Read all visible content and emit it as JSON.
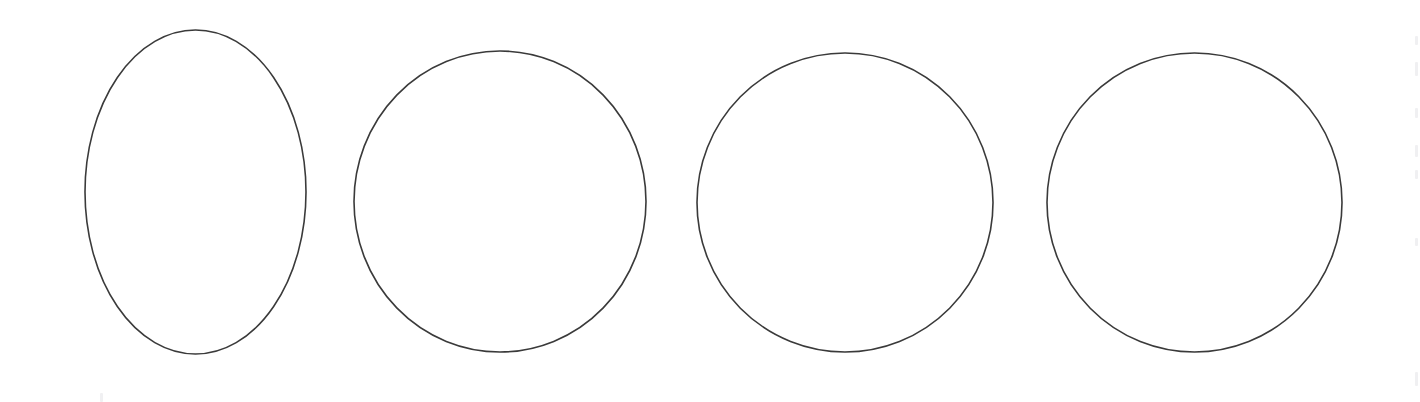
{
  "page": {
    "width": 1420,
    "height": 402,
    "background_color": "#ffffff"
  },
  "style": {
    "stroke_color": "#3a3a3a",
    "stroke_width": 1.6,
    "fill": "none",
    "artifact_color": "#f0f0f2"
  },
  "chart_data": {
    "type": "scatter",
    "title": "",
    "subtitle": "",
    "xlabel": "",
    "ylabel": "",
    "grid": false,
    "legend": "none",
    "xlim": [
      0,
      1420
    ],
    "ylim": [
      0,
      402
    ],
    "shapes": [
      {
        "id": "shape-1",
        "label": "Ellipse",
        "kind": "ellipse",
        "cx": 195.5,
        "cy": 192,
        "rx": 110.5,
        "ry": 162,
        "width": 221,
        "height": 324,
        "left": 85,
        "top": 30,
        "right": 306,
        "bottom": 354,
        "aspect_ratio": "0.68"
      },
      {
        "id": "shape-2",
        "label": "Circle",
        "kind": "ellipse",
        "cx": 500,
        "cy": 201.5,
        "rx": 146,
        "ry": 150.5,
        "width": 292,
        "height": 301,
        "left": 354,
        "top": 51,
        "right": 646,
        "bottom": 352,
        "aspect_ratio": "0.97"
      },
      {
        "id": "shape-3",
        "label": "Circle",
        "kind": "ellipse",
        "cx": 845,
        "cy": 202.5,
        "rx": 148,
        "ry": 149.5,
        "width": 296,
        "height": 299,
        "left": 697,
        "top": 53,
        "right": 993,
        "bottom": 352,
        "aspect_ratio": "0.99"
      },
      {
        "id": "shape-4",
        "label": "Circle",
        "kind": "ellipse",
        "cx": 1194.5,
        "cy": 202.5,
        "rx": 147.5,
        "ry": 149.5,
        "width": 295,
        "height": 299,
        "left": 1047,
        "top": 53,
        "right": 1342,
        "bottom": 352,
        "aspect_ratio": "0.99"
      }
    ]
  },
  "artifacts": {
    "right_edge_marks": [
      {
        "top": 36,
        "height": 9
      },
      {
        "top": 62,
        "height": 14
      },
      {
        "top": 108,
        "height": 10
      },
      {
        "top": 145,
        "height": 12
      },
      {
        "top": 170,
        "height": 9
      },
      {
        "top": 238,
        "height": 8
      },
      {
        "top": 372,
        "height": 14
      }
    ],
    "bottom_left_mark": {
      "left": 100,
      "top": 393,
      "width": 3,
      "height": 9
    }
  }
}
